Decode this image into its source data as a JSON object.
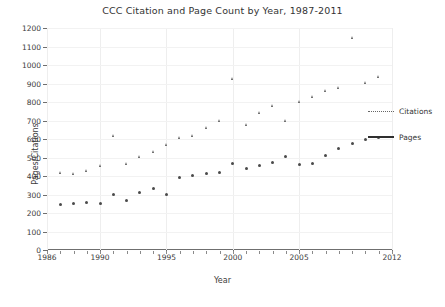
{
  "chart_data": {
    "type": "scatter",
    "title": "CCC Citation and Page Count by Year, 1987-2011",
    "xlabel": "Year",
    "ylabel": "Pages/Citations",
    "xlim": [
      1986,
      2012
    ],
    "ylim": [
      0,
      1200
    ],
    "xticks": [
      1986,
      1990,
      1995,
      2000,
      2005,
      2012
    ],
    "xticklabels": [
      "1986",
      "1990",
      "1995",
      "2000",
      "2005",
      "2012"
    ],
    "yticks": [
      0,
      100,
      200,
      300,
      400,
      500,
      600,
      700,
      800,
      900,
      1000,
      1100,
      1200
    ],
    "yticklabels": [
      "0",
      "100",
      "200",
      "300",
      "400",
      "500",
      "600",
      "700",
      "800",
      "900",
      "1000",
      "1100",
      "1200"
    ],
    "grid": true,
    "legend_position": "right",
    "series": [
      {
        "name": "Citations",
        "marker": "triangle",
        "x": [
          1987,
          1988,
          1989,
          1990,
          1991,
          1992,
          1993,
          1994,
          1995,
          1996,
          1997,
          1998,
          1999,
          2000,
          2001,
          2002,
          2003,
          2004,
          2005,
          2006,
          2007,
          2008,
          2009,
          2010,
          2011
        ],
        "y": [
          420,
          415,
          430,
          455,
          620,
          470,
          505,
          530,
          570,
          610,
          620,
          660,
          700,
          925,
          680,
          745,
          780,
          700,
          805,
          830,
          860,
          880,
          1150,
          905,
          940
        ],
        "trendline": {
          "equation": "y = 34.497x - 66,280.8232",
          "r2_label": "R² = 0.8364",
          "slope": 34.497,
          "intercept": -66280.8232,
          "r2": 0.8364,
          "style": "dotted"
        }
      },
      {
        "name": "Pages",
        "marker": "circle",
        "x": [
          1987,
          1988,
          1989,
          1990,
          1991,
          1992,
          1993,
          1994,
          1995,
          1996,
          1997,
          1998,
          1999,
          2000,
          2001,
          2002,
          2003,
          2004,
          2005,
          2006,
          2007,
          2008,
          2009,
          2010,
          2011
        ],
        "y": [
          245,
          250,
          255,
          250,
          300,
          265,
          310,
          335,
          300,
          390,
          405,
          415,
          420,
          470,
          440,
          455,
          475,
          505,
          460,
          470,
          510,
          550,
          575,
          600,
          610
        ],
        "trendline": {
          "equation": "y = 18.4973x - 30,555.125",
          "r2_label": "R² = 0.8562",
          "slope": 18.4973,
          "intercept": -30555.125,
          "r2": 0.8562,
          "style": "solid"
        }
      }
    ]
  },
  "legend": {
    "items": [
      {
        "label": "Citations",
        "style": "dotted"
      },
      {
        "label": "Pages",
        "style": "solid"
      }
    ]
  }
}
